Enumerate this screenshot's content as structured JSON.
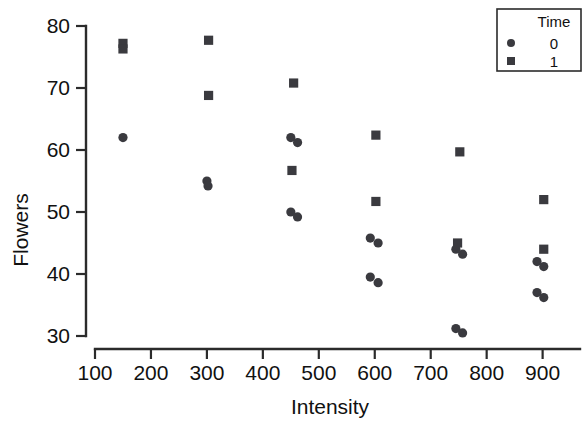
{
  "chart_data": {
    "type": "scatter",
    "title": "",
    "xlabel": "Intensity",
    "ylabel": "Flowers",
    "xlim": [
      100,
      940
    ],
    "ylim": [
      30,
      80
    ],
    "grid": false,
    "legend": {
      "title": "Time",
      "position": "top-right",
      "entries": [
        {
          "label": "0",
          "marker": "circle"
        },
        {
          "label": "1",
          "marker": "square"
        }
      ]
    },
    "xticks": [
      100,
      200,
      300,
      400,
      500,
      600,
      700,
      800,
      900
    ],
    "xtick_labels": [
      "100",
      "200",
      "300",
      "400",
      "500",
      "600",
      "700",
      "800",
      "900"
    ],
    "yticks": [
      30,
      40,
      50,
      60,
      70,
      80
    ],
    "ytick_labels": [
      "30",
      "40",
      "50",
      "60",
      "70",
      "80"
    ],
    "series": [
      {
        "name": "0",
        "marker": "circle",
        "color": "#3a3a3f",
        "points": [
          [
            150,
            62.0
          ],
          [
            300,
            55.0
          ],
          [
            302,
            54.2
          ],
          [
            450,
            62.0
          ],
          [
            462,
            61.2
          ],
          [
            450,
            50.0
          ],
          [
            462,
            49.2
          ],
          [
            592,
            45.8
          ],
          [
            606,
            45.0
          ],
          [
            592,
            39.5
          ],
          [
            606,
            38.6
          ],
          [
            745,
            44.0
          ],
          [
            757,
            43.2
          ],
          [
            745,
            31.2
          ],
          [
            757,
            30.5
          ],
          [
            890,
            42.0
          ],
          [
            902,
            41.2
          ],
          [
            890,
            37.0
          ],
          [
            902,
            36.2
          ]
        ]
      },
      {
        "name": "1",
        "marker": "square",
        "color": "#3a3a3f",
        "points": [
          [
            150,
            77.2
          ],
          [
            150,
            76.3
          ],
          [
            303,
            77.7
          ],
          [
            303,
            68.8
          ],
          [
            455,
            70.8
          ],
          [
            452,
            56.7
          ],
          [
            602,
            62.4
          ],
          [
            602,
            51.7
          ],
          [
            752,
            59.7
          ],
          [
            748,
            45.0
          ],
          [
            902,
            52.0
          ],
          [
            902,
            44.0
          ]
        ]
      }
    ]
  }
}
